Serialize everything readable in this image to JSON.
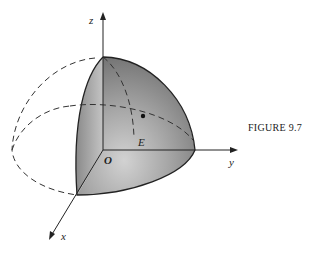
{
  "figure": {
    "caption": "FIGURE 9.7",
    "labels": {
      "z_axis": "z",
      "y_axis": "y",
      "x_axis": "x",
      "origin": "O",
      "region": "E"
    }
  }
}
